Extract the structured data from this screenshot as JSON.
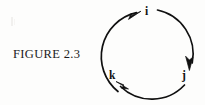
{
  "figure": {
    "caption": "FIGURE 2.3",
    "background_color": "#fdfdfc",
    "ink_color": "#101010"
  },
  "diagram": {
    "type": "directed-cycle",
    "center": {
      "x": 148.5,
      "y": 54
    },
    "radius": 45,
    "stroke_width": 1.6,
    "nodes": [
      {
        "id": "i",
        "label": "i",
        "angle_deg": 90,
        "x": 148,
        "y": 9
      },
      {
        "id": "j",
        "label": "j",
        "angle_deg": -55,
        "x": 184,
        "y": 76
      },
      {
        "id": "k",
        "label": "k",
        "angle_deg": 235,
        "x": 113,
        "y": 76
      }
    ],
    "edges": [
      {
        "from": "k",
        "to": "i",
        "direction": "counterclockwise",
        "arrowhead_at": "i"
      },
      {
        "from": "i",
        "to": "j",
        "direction": "clockwise",
        "arrowhead_at": "j"
      },
      {
        "from": "j",
        "to": "k",
        "direction": "clockwise",
        "arrowhead_at": "k"
      }
    ]
  }
}
